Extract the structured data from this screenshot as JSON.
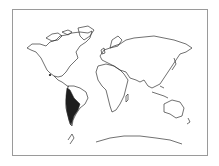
{
  "map": {
    "type": "world distribution map",
    "projection": "outline world map",
    "frame_color": "#9a9a9a",
    "coast_color": "#333333",
    "range_color": "#1e1e1e",
    "background": "#ffffff",
    "highlighted_regions": [
      {
        "name": "western South America (Andes / Pacific coast)",
        "fill": "#1e1e1e"
      },
      {
        "name": "Central America (small spot)",
        "fill": "#1e1e1e"
      }
    ]
  }
}
